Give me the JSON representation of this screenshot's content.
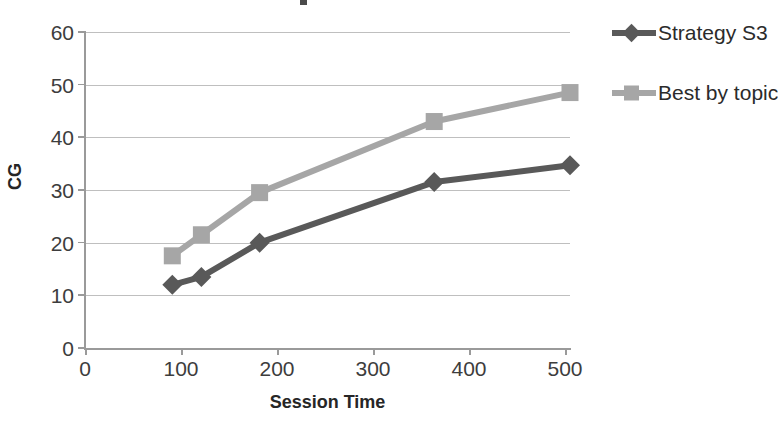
{
  "chart_data": {
    "type": "line",
    "title": "",
    "xlabel": "Session Time",
    "ylabel": "CG",
    "xlim": [
      0,
      500
    ],
    "ylim": [
      0,
      60
    ],
    "x_ticks": [
      0,
      100,
      200,
      300,
      400,
      500
    ],
    "y_ticks": [
      0,
      10,
      20,
      30,
      40,
      50,
      60
    ],
    "grid": true,
    "legend_position": "right",
    "x": [
      90,
      120,
      180,
      360,
      500
    ],
    "series": [
      {
        "name": "Strategy S3",
        "color": "#595959",
        "marker": "diamond",
        "values": [
          12,
          13.5,
          20,
          31.5,
          34.7
        ]
      },
      {
        "name": "Best by topic",
        "color": "#a6a6a6",
        "marker": "square",
        "values": [
          17.5,
          21.5,
          29.5,
          43,
          48.5
        ]
      }
    ]
  },
  "axes": {
    "y_tick_labels": [
      "60",
      "50",
      "40",
      "30",
      "20",
      "10",
      "0"
    ],
    "x_tick_labels": [
      "0",
      "100",
      "200",
      "300",
      "400",
      "500"
    ],
    "x_title": "Session Time",
    "y_title": "CG"
  },
  "legend": {
    "items": [
      {
        "label": "Strategy S3",
        "color": "#595959",
        "marker": "diamond"
      },
      {
        "label": "Best by topic",
        "color": "#a6a6a6",
        "marker": "square"
      }
    ]
  },
  "colors": {
    "series_dark": "#595959",
    "series_light": "#a6a6a6",
    "gridline": "#bfbfbf",
    "axis": "#9a9a9a",
    "text": "#3d3d3d",
    "background": "#ffffff"
  }
}
